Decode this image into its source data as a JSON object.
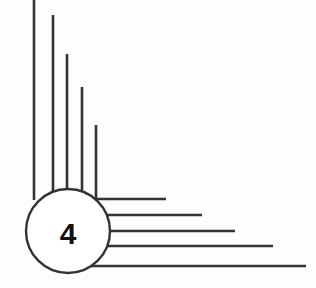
{
  "diagram": {
    "badge": {
      "label": "4",
      "cx": 68,
      "cy": 231,
      "r": 42
    },
    "stroke_color": "#333333",
    "fill_color": "#ffffff",
    "vertical_lines": [
      {
        "x": 34,
        "y1": 0,
        "y2": 200
      },
      {
        "x": 53,
        "y1": 15,
        "y2": 200
      },
      {
        "x": 67,
        "y1": 54,
        "y2": 200
      },
      {
        "x": 82,
        "y1": 87,
        "y2": 200
      },
      {
        "x": 96,
        "y1": 125,
        "y2": 200
      }
    ],
    "horizontal_lines": [
      {
        "y": 199,
        "x1": 90,
        "x2": 166
      },
      {
        "y": 215,
        "x1": 90,
        "x2": 202
      },
      {
        "y": 231,
        "x1": 90,
        "x2": 235
      },
      {
        "y": 246,
        "x1": 90,
        "x2": 273
      },
      {
        "y": 266,
        "x1": 90,
        "x2": 306
      }
    ]
  }
}
